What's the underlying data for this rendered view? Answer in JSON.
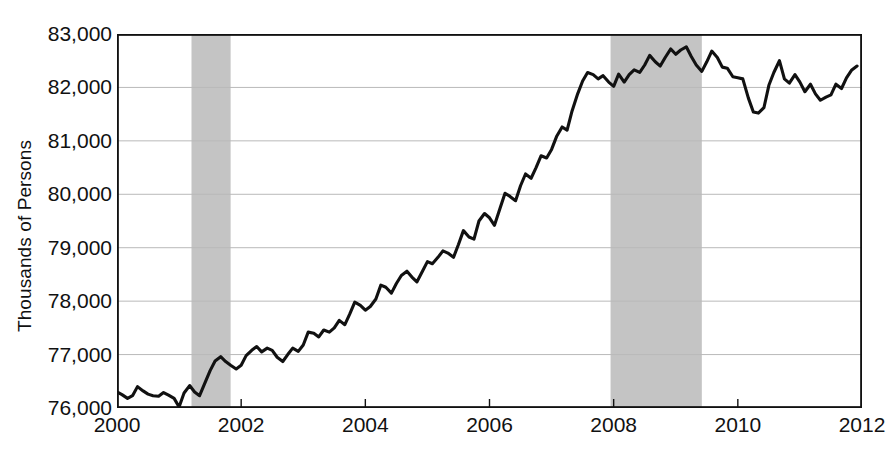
{
  "axis": {
    "ylabel": "Thousands of Persons",
    "yticks": [
      "76,000",
      "77,000",
      "78,000",
      "79,000",
      "80,000",
      "81,000",
      "82,000",
      "83,000"
    ],
    "xticks": [
      "2000",
      "2002",
      "2004",
      "2006",
      "2008",
      "2010",
      "2012"
    ]
  },
  "colors": {
    "line": "#111111",
    "axis": "#111111",
    "grid": "#b9b9b9",
    "recession_band": "#c4c4c4",
    "background": "#ffffff"
  },
  "chart_data": {
    "type": "line",
    "title": "",
    "xlabel": "",
    "ylabel": "Thousands of Persons",
    "xlim": [
      2000.0,
      2012.0
    ],
    "ylim": [
      76000,
      83000
    ],
    "ytick_values": [
      76000,
      77000,
      78000,
      79000,
      80000,
      81000,
      82000,
      83000
    ],
    "xtick_values": [
      2000,
      2002,
      2004,
      2006,
      2008,
      2010,
      2012
    ],
    "grid": "horizontal",
    "legend": "none",
    "units": "Thousands of Persons",
    "annotations": [
      {
        "type": "shaded-band",
        "name": "recession-2001",
        "x_start": 2001.2,
        "x_end": 2001.83
      },
      {
        "type": "shaded-band",
        "name": "recession-2008",
        "x_start": 2007.95,
        "x_end": 2009.42
      }
    ],
    "series": [
      {
        "name": "Employment",
        "x": [
          2000.0,
          2000.08,
          2000.17,
          2000.25,
          2000.33,
          2000.42,
          2000.5,
          2000.58,
          2000.67,
          2000.75,
          2000.83,
          2000.92,
          2001.0,
          2001.08,
          2001.17,
          2001.25,
          2001.33,
          2001.42,
          2001.5,
          2001.58,
          2001.67,
          2001.75,
          2001.83,
          2001.92,
          2002.0,
          2002.08,
          2002.17,
          2002.25,
          2002.33,
          2002.42,
          2002.5,
          2002.58,
          2002.67,
          2002.75,
          2002.83,
          2002.92,
          2003.0,
          2003.08,
          2003.17,
          2003.25,
          2003.33,
          2003.42,
          2003.5,
          2003.58,
          2003.67,
          2003.75,
          2003.83,
          2003.92,
          2004.0,
          2004.08,
          2004.17,
          2004.25,
          2004.33,
          2004.42,
          2004.5,
          2004.58,
          2004.67,
          2004.75,
          2004.83,
          2004.92,
          2005.0,
          2005.08,
          2005.17,
          2005.25,
          2005.33,
          2005.42,
          2005.5,
          2005.58,
          2005.67,
          2005.75,
          2005.83,
          2005.92,
          2006.0,
          2006.08,
          2006.17,
          2006.25,
          2006.33,
          2006.42,
          2006.5,
          2006.58,
          2006.67,
          2006.75,
          2006.83,
          2006.92,
          2007.0,
          2007.08,
          2007.17,
          2007.25,
          2007.33,
          2007.42,
          2007.5,
          2007.58,
          2007.67,
          2007.75,
          2007.83,
          2007.92,
          2008.0,
          2008.08,
          2008.17,
          2008.25,
          2008.33,
          2008.42,
          2008.5,
          2008.58,
          2008.67,
          2008.75,
          2008.83,
          2008.92,
          2009.0,
          2009.08,
          2009.17,
          2009.25,
          2009.33,
          2009.42,
          2009.5,
          2009.58,
          2009.67,
          2009.75,
          2009.83,
          2009.92,
          2010.0,
          2010.08,
          2010.17,
          2010.25,
          2010.33,
          2010.42,
          2010.5,
          2010.58,
          2010.67,
          2010.75,
          2010.83,
          2010.92,
          2011.0,
          2011.08,
          2011.17,
          2011.25,
          2011.33,
          2011.42,
          2011.5,
          2011.58,
          2011.67,
          2011.75,
          2011.83,
          2011.92
        ],
        "y": [
          76300,
          76250,
          76180,
          76230,
          76400,
          76320,
          76260,
          76230,
          76220,
          76290,
          76240,
          76180,
          76020,
          76280,
          76420,
          76300,
          76230,
          76480,
          76700,
          76880,
          76960,
          76870,
          76800,
          76730,
          76800,
          76980,
          77080,
          77150,
          77050,
          77120,
          77080,
          76950,
          76870,
          77000,
          77120,
          77060,
          77180,
          77420,
          77400,
          77330,
          77460,
          77420,
          77500,
          77640,
          77560,
          77760,
          77980,
          77920,
          77830,
          77900,
          78040,
          78300,
          78260,
          78150,
          78330,
          78480,
          78560,
          78450,
          78360,
          78560,
          78740,
          78700,
          78820,
          78940,
          78900,
          78820,
          79060,
          79320,
          79200,
          79160,
          79500,
          79640,
          79560,
          79420,
          79740,
          80020,
          79960,
          79880,
          80160,
          80380,
          80300,
          80500,
          80720,
          80680,
          80840,
          81080,
          81260,
          81200,
          81560,
          81880,
          82120,
          82280,
          82240,
          82160,
          82220,
          82100,
          82020,
          82250,
          82100,
          82240,
          82330,
          82280,
          82420,
          82600,
          82480,
          82400,
          82560,
          82720,
          82620,
          82700,
          82760,
          82580,
          82420,
          82300,
          82480,
          82680,
          82560,
          82380,
          82360,
          82200,
          82180,
          82160,
          81800,
          81540,
          81520,
          81620,
          82040,
          82280,
          82500,
          82160,
          82080,
          82240,
          82100,
          81920,
          82060,
          81880,
          81760,
          81820,
          81860,
          82060,
          81980,
          82180,
          82320,
          82400
        ]
      }
    ]
  }
}
